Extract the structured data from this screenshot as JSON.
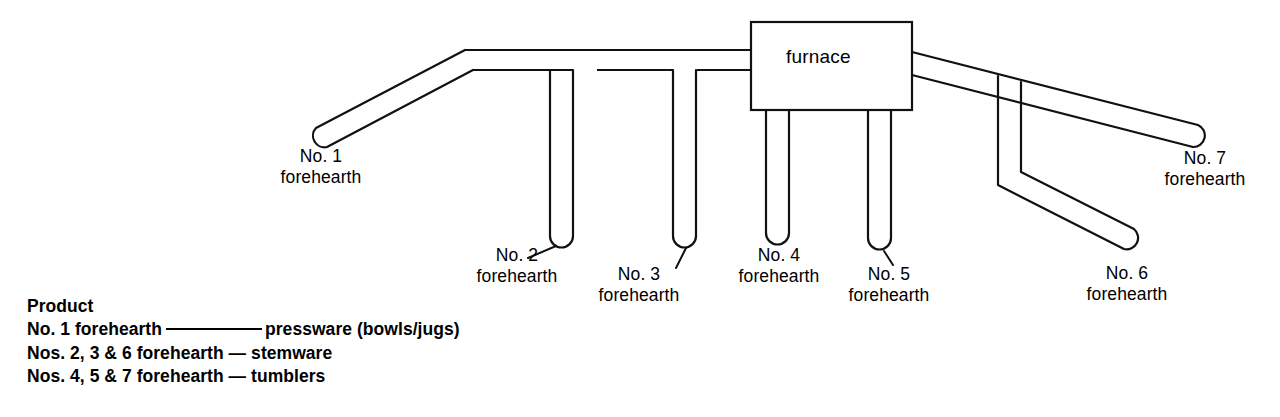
{
  "diagram": {
    "furnace": {
      "label": "furnace"
    },
    "stroke_color": "#111111",
    "background_color": "#ffffff",
    "forehearths": [
      {
        "id": "1",
        "number": "No. 1",
        "line1": "No. 1",
        "line2": "forehearth"
      },
      {
        "id": "2",
        "number": "No. 2",
        "line1": "No. 2",
        "line2": "forehearth"
      },
      {
        "id": "3",
        "number": "No. 3",
        "line1": "No. 3",
        "line2": "forehearth"
      },
      {
        "id": "4",
        "number": "No. 4",
        "line1": "No. 4",
        "line2": "forehearth"
      },
      {
        "id": "5",
        "number": "No. 5",
        "line1": "No. 5",
        "line2": "forehearth"
      },
      {
        "id": "6",
        "number": "No. 6",
        "line1": "No. 6",
        "line2": "forehearth"
      },
      {
        "id": "7",
        "number": "No. 7",
        "line1": "No. 7",
        "line2": "forehearth"
      }
    ]
  },
  "legend": {
    "heading": "Product",
    "rows": [
      {
        "source": "No. 1 forehearth",
        "separator": "rule",
        "product": "pressware (bowls/jugs)"
      },
      {
        "source": "Nos. 2, 3 & 6 forehearth",
        "separator": "—",
        "product": "stemware"
      },
      {
        "source": "Nos. 4, 5 & 7 forehearth",
        "separator": "—",
        "product": "tumblers"
      }
    ]
  }
}
